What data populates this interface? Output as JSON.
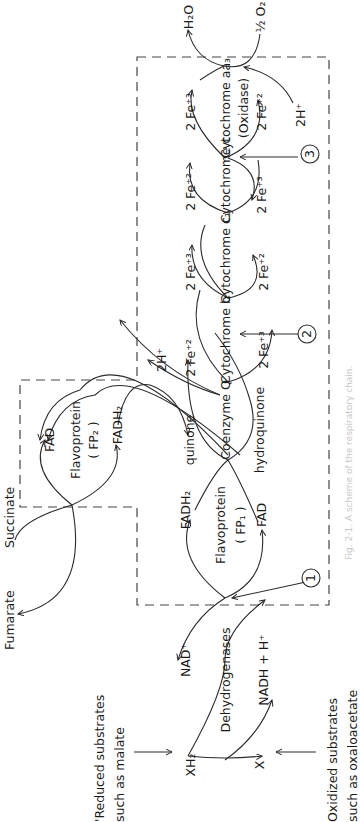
{
  "figure": {
    "caption": "Fig. 2-1. A scheme of the respiratory chain.",
    "orientation": "rotated 90° counter-clockwise",
    "colors": {
      "ink": "#1a1a1a",
      "background": "#ffffff",
      "caption": "#c8c8c8"
    }
  },
  "inputs": {
    "reduced_substrates": {
      "line1": "'Reduced substrates",
      "line2": "such as malate"
    },
    "oxidized_substrates": {
      "line1": "Oxidized substrates",
      "line2": "such as oxaloacetate"
    },
    "xh2": "XH₂",
    "x": "X"
  },
  "nodes": {
    "dehydrogenases": {
      "label": "Dehydrogenases",
      "nad": "NAD⁺",
      "nadh": "NADH + H⁺"
    },
    "fp1": {
      "label1": "Flavoprotein",
      "label2": "( FP₁ )",
      "fadh2": "FADH₂",
      "fad": "FAD"
    },
    "fp2": {
      "label1": "Flavoprotein",
      "label2": "( FP₂ )",
      "fad": "FAD",
      "fadh2": "FADH₂",
      "succinate": "Succinate",
      "fumarate": "Fumarate"
    },
    "coq": {
      "label": "Coenzyme Q",
      "quinone": "quinone",
      "hydroquinone": "hydroquinone",
      "h_out": "2H⁺"
    },
    "cyt_b": {
      "label": "Cytochrome b",
      "fe_top": "2 Fe⁺²",
      "fe_bottom": "2 Fe⁺³"
    },
    "cyt_c1": {
      "label": "Cytochrome c₁",
      "fe_top": "2 Fe⁺³",
      "fe_bottom": "2 Fe⁺²"
    },
    "cyt_c": {
      "label": "Cytochrome c",
      "fe_top": "2 Fe⁺²",
      "fe_bottom": "2 Fe⁺³"
    },
    "cyt_aa3": {
      "label1": "Cytochrome aa₃",
      "label2": "(Oxidase)",
      "fe_top": "2 Fe⁺³",
      "fe_bottom": "2 Fe⁺²",
      "h_in": "2H⁺"
    },
    "oxygen": {
      "h2o": "H₂O",
      "o2": "½ O₂"
    }
  },
  "sites": [
    {
      "number": "1"
    },
    {
      "number": "2"
    },
    {
      "number": "3"
    }
  ]
}
